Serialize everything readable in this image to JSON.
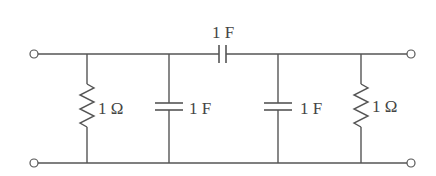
{
  "diagram": {
    "type": "circuit-schematic",
    "components": [
      {
        "id": "R1",
        "kind": "resistor",
        "placement": "shunt",
        "label": "1 Ω"
      },
      {
        "id": "C1",
        "kind": "capacitor",
        "placement": "shunt",
        "label": "1 F"
      },
      {
        "id": "C2",
        "kind": "capacitor",
        "placement": "series",
        "label": "1 F"
      },
      {
        "id": "C3",
        "kind": "capacitor",
        "placement": "shunt",
        "label": "1 F"
      },
      {
        "id": "R2",
        "kind": "resistor",
        "placement": "shunt",
        "label": "1 Ω"
      }
    ],
    "terminals": [
      "input-top",
      "input-bottom",
      "output-top",
      "output-bottom"
    ],
    "colors": {
      "line": "#555555",
      "text": "#444444",
      "background": "#ffffff"
    }
  },
  "labels": {
    "r1": "1 Ω",
    "c1": "1 F",
    "c2": "1 F",
    "c3": "1 F",
    "r2": "1 Ω"
  }
}
